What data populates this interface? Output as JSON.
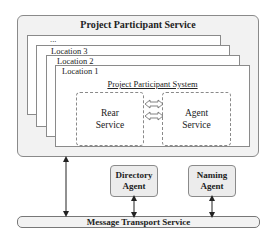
{
  "diagram": {
    "outer_box": {
      "title": "Project Participant Service"
    },
    "location_stack": [
      {
        "label": "..."
      },
      {
        "label": "Location 3"
      },
      {
        "label": "Location 2"
      },
      {
        "label": "Location 1"
      }
    ],
    "system": {
      "title": "Project Participant System",
      "rear_service": {
        "line1": "Rear",
        "line2": "Service"
      },
      "agent_service": {
        "line1": "Agent",
        "line2": "Service"
      },
      "connectors": [
        "bidirectional-arrow",
        "bidirectional-arrow"
      ]
    },
    "agents": [
      {
        "line1": "Directory",
        "line2": "Agent"
      },
      {
        "line1": "Naming",
        "line2": "Agent"
      }
    ],
    "bus": {
      "label": "Message Transport Service"
    },
    "colors": {
      "box_fill": "#f2f2f2",
      "agent_fill": "#ececec",
      "border": "#8a8a8a",
      "text": "#222222"
    }
  }
}
